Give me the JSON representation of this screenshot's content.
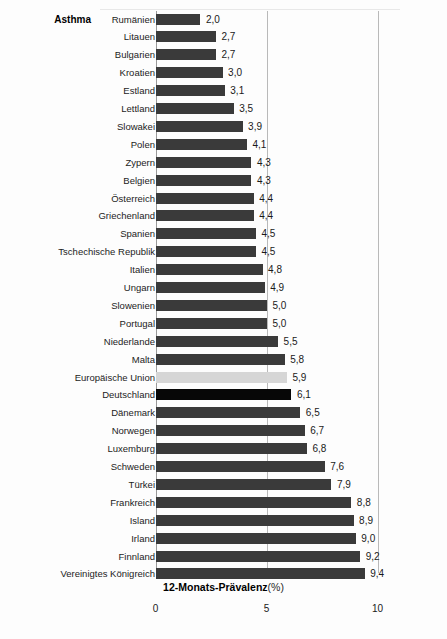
{
  "chart_data": {
    "type": "bar",
    "orientation": "horizontal",
    "title": "Asthma",
    "xlabel": "12-Monats-Prävalenz (%)",
    "xlabel_bold_part": "12-Monats-Prävalenz",
    "xlabel_unit_part": "(%)",
    "ylabel": "",
    "xlim": [
      0,
      10
    ],
    "xticks": [
      0,
      5,
      10
    ],
    "xtick_labels": [
      "0",
      "5",
      "10"
    ],
    "grid": "vertical gridlines at 5 and 10",
    "legend": "none",
    "decimal_separator": ",",
    "categories": [
      "Rumänien",
      "Litauen",
      "Bulgarien",
      "Kroatien",
      "Estland",
      "Lettland",
      "Slowakei",
      "Polen",
      "Zypern",
      "Belgien",
      "Österreich",
      "Griechenland",
      "Spanien",
      "Tschechische Republik",
      "Italien",
      "Ungarn",
      "Slowenien",
      "Portugal",
      "Niederlande",
      "Malta",
      "Europäische Union",
      "Deutschland",
      "Dänemark",
      "Norwegen",
      "Luxemburg",
      "Schweden",
      "Türkei",
      "Frankreich",
      "Island",
      "Irland",
      "Finnland",
      "Vereinigtes Königreich"
    ],
    "values": [
      2.0,
      2.7,
      2.7,
      3.0,
      3.1,
      3.5,
      3.9,
      4.1,
      4.3,
      4.3,
      4.4,
      4.4,
      4.5,
      4.5,
      4.8,
      4.9,
      5.0,
      5.0,
      5.5,
      5.8,
      5.9,
      6.1,
      6.5,
      6.7,
      6.8,
      7.6,
      7.9,
      8.8,
      8.9,
      9.0,
      9.2,
      9.4
    ],
    "value_labels": [
      "2,0",
      "2,7",
      "2,7",
      "3,0",
      "3,1",
      "3,5",
      "3,9",
      "4,1",
      "4,3",
      "4,3",
      "4,4",
      "4,4",
      "4,5",
      "4,5",
      "4,8",
      "4,9",
      "5,0",
      "5,0",
      "5,5",
      "5,8",
      "5,9",
      "6,1",
      "6,5",
      "6,7",
      "6,8",
      "7,6",
      "7,9",
      "8,8",
      "8,9",
      "9,0",
      "9,2",
      "9,4"
    ],
    "bar_styles": [
      "default",
      "default",
      "default",
      "default",
      "default",
      "default",
      "default",
      "default",
      "default",
      "default",
      "default",
      "default",
      "default",
      "default",
      "default",
      "default",
      "default",
      "default",
      "default",
      "default",
      "eu",
      "focus",
      "default",
      "default",
      "default",
      "default",
      "default",
      "default",
      "default",
      "default",
      "default",
      "default"
    ],
    "colors": {
      "default_bar": "#3a3a3a",
      "eu_bar": "#d6d6d6",
      "focus_bar": "#070707",
      "gridline": "#b9b9b9",
      "axis": "#9a9a9a",
      "background": "#fdfdfd",
      "text": "#1a1a1a"
    }
  }
}
